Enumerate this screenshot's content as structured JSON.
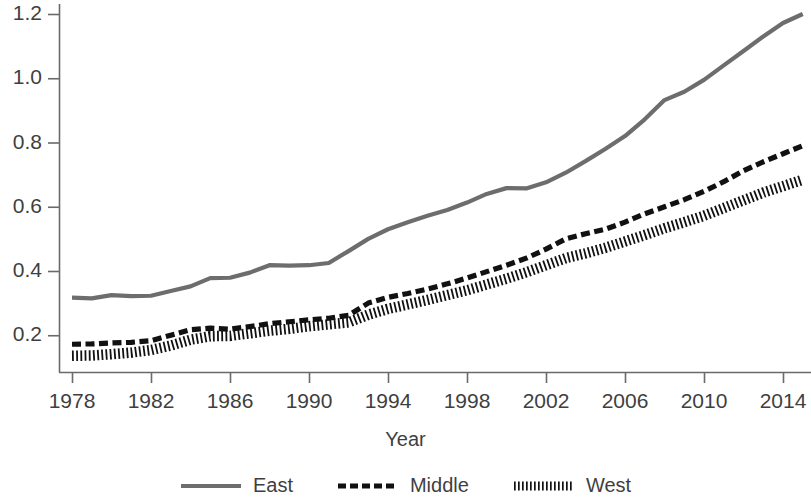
{
  "chart_data": {
    "type": "line",
    "title": "",
    "xlabel": "Year",
    "ylabel": "",
    "xlim": [
      1977,
      2015.6
    ],
    "ylim": [
      0.1,
      1.25
    ],
    "grid": false,
    "legend_position": "bottom",
    "xticks": [
      1978,
      1982,
      1986,
      1990,
      1994,
      1998,
      2002,
      2006,
      2010,
      2014
    ],
    "yticks": [
      0.2,
      0.4,
      0.6,
      0.8,
      1.0,
      1.2
    ],
    "x": [
      1978,
      1979,
      1980,
      1981,
      1982,
      1983,
      1984,
      1985,
      1986,
      1987,
      1988,
      1989,
      1990,
      1991,
      1992,
      1993,
      1994,
      1995,
      1996,
      1997,
      1998,
      1999,
      2000,
      2001,
      2002,
      2003,
      2004,
      2005,
      2006,
      2007,
      2008,
      2009,
      2010,
      2011,
      2012,
      2013,
      2014,
      2015
    ],
    "series": [
      {
        "name": "East",
        "style": "solid",
        "color": "#6d6d6d",
        "values": [
          0.317,
          0.315,
          0.325,
          0.322,
          0.323,
          0.338,
          0.352,
          0.378,
          0.379,
          0.395,
          0.418,
          0.417,
          0.418,
          0.425,
          0.462,
          0.5,
          0.53,
          0.552,
          0.572,
          0.59,
          0.613,
          0.64,
          0.658,
          0.657,
          0.676,
          0.706,
          0.742,
          0.78,
          0.82,
          0.872,
          0.932,
          0.958,
          0.995,
          1.04,
          1.085,
          1.13,
          1.172,
          1.2
        ]
      },
      {
        "name": "Middle",
        "style": "dashed",
        "color": "#111111",
        "values": [
          0.172,
          0.173,
          0.176,
          0.178,
          0.183,
          0.2,
          0.217,
          0.222,
          0.219,
          0.227,
          0.236,
          0.242,
          0.248,
          0.253,
          0.262,
          0.3,
          0.318,
          0.33,
          0.344,
          0.36,
          0.378,
          0.398,
          0.418,
          0.44,
          0.468,
          0.5,
          0.516,
          0.53,
          0.552,
          0.578,
          0.6,
          0.622,
          0.648,
          0.678,
          0.712,
          0.74,
          0.765,
          0.79
        ]
      },
      {
        "name": "West",
        "style": "dotted",
        "color": "#111111",
        "values": [
          0.136,
          0.137,
          0.141,
          0.146,
          0.154,
          0.168,
          0.186,
          0.197,
          0.198,
          0.206,
          0.214,
          0.22,
          0.228,
          0.234,
          0.24,
          0.264,
          0.282,
          0.296,
          0.31,
          0.325,
          0.34,
          0.358,
          0.376,
          0.396,
          0.418,
          0.44,
          0.455,
          0.472,
          0.492,
          0.512,
          0.533,
          0.552,
          0.572,
          0.596,
          0.62,
          0.644,
          0.664,
          0.684
        ]
      }
    ]
  },
  "axis": {
    "line_color": "#6a6a6a"
  },
  "legend": {
    "entries": [
      {
        "label": "East"
      },
      {
        "label": "Middle"
      },
      {
        "label": "West"
      }
    ]
  }
}
